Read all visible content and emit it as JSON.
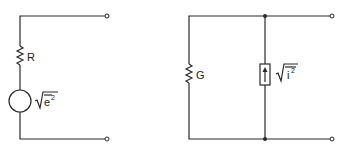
{
  "diagram": {
    "left_circuit": {
      "name": "Thevenin noise equivalent",
      "resistor_label": "R",
      "source_label_base": "e",
      "source_label_exp": "2",
      "source_type": "voltage-source"
    },
    "right_circuit": {
      "name": "Norton noise equivalent",
      "conductance_label": "G",
      "source_label_base": "i",
      "source_label_exp": "2",
      "source_type": "current-source"
    },
    "colors": {
      "wire": "#2a2a2a",
      "background": "#ffffff"
    }
  }
}
